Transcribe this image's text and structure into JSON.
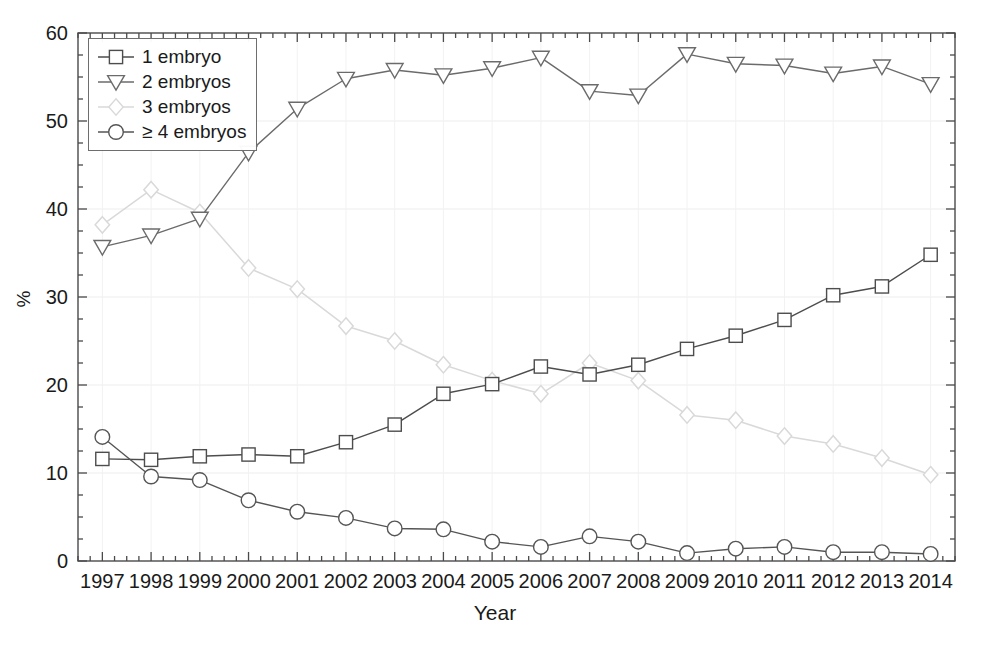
{
  "chart_data": {
    "type": "line",
    "title": "",
    "xlabel": "Year",
    "ylabel": "%",
    "xlim": [
      1996.5,
      2014.5
    ],
    "ylim": [
      0,
      60
    ],
    "yticks": [
      0,
      10,
      20,
      30,
      40,
      50,
      60
    ],
    "ytick_labels": [
      "0",
      "10",
      "20",
      "30",
      "40",
      "50",
      "60"
    ],
    "y_minor_step": 2.5,
    "grid": true,
    "legend_position": "upper-left",
    "categories": [
      1997,
      1998,
      1999,
      2000,
      2001,
      2002,
      2003,
      2004,
      2005,
      2006,
      2007,
      2008,
      2009,
      2010,
      2011,
      2012,
      2013,
      2014
    ],
    "xtick_labels": [
      "1997",
      "1998",
      "1999",
      "2000",
      "2001",
      "2002",
      "2003",
      "2004",
      "2005",
      "2006",
      "2007",
      "2008",
      "2009",
      "2010",
      "2011",
      "2012",
      "2013",
      "2014"
    ],
    "series": [
      {
        "name": "1 embryo",
        "marker": "square",
        "color": "#4d4d4d",
        "values": [
          11.6,
          11.5,
          11.9,
          12.1,
          11.9,
          13.5,
          15.5,
          19.0,
          20.1,
          22.1,
          21.2,
          22.3,
          24.1,
          25.6,
          27.4,
          30.2,
          31.2,
          34.8
        ]
      },
      {
        "name": "2 embryos",
        "marker": "triangle-down",
        "color": "#6b6b6b",
        "values": [
          35.7,
          37.0,
          38.9,
          46.4,
          51.4,
          54.8,
          55.8,
          55.2,
          56.0,
          57.2,
          53.4,
          52.9,
          57.6,
          56.5,
          56.3,
          55.4,
          56.2,
          54.2
        ]
      },
      {
        "name": "3 embryos",
        "marker": "diamond",
        "color": "#d9d9d9",
        "values": [
          38.2,
          42.2,
          39.6,
          33.3,
          30.9,
          26.7,
          25.0,
          22.3,
          20.5,
          19.0,
          22.5,
          20.5,
          16.6,
          16.0,
          14.2,
          13.3,
          11.7,
          9.8
        ]
      },
      {
        "name": "≥ 4 embryos",
        "marker": "circle",
        "color": "#555555",
        "values": [
          14.1,
          9.6,
          9.2,
          6.9,
          5.6,
          4.9,
          3.7,
          3.6,
          2.2,
          1.6,
          2.8,
          2.2,
          0.9,
          1.4,
          1.6,
          1.0,
          1.0,
          0.8
        ]
      }
    ]
  },
  "legend": {
    "items": [
      {
        "label": "1 embryo"
      },
      {
        "label": "2 embryos"
      },
      {
        "label": "3 embryos"
      },
      {
        "label": "≥ 4 embryos"
      }
    ]
  },
  "axes": {
    "y_title": "%",
    "x_title": "Year"
  }
}
